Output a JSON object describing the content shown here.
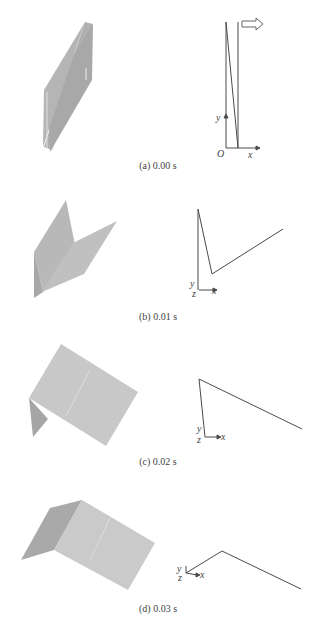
{
  "panels": [
    {
      "id": "a",
      "caption": "(a) 0.00 s",
      "time_s": 0.0,
      "axes": {
        "y": "y",
        "x": "x",
        "origin": "O"
      },
      "has_velocity_arrow": true
    },
    {
      "id": "b",
      "caption": "(b) 0.01 s",
      "time_s": 0.01,
      "axes": {
        "y": "y",
        "x": "x",
        "z": "z"
      }
    },
    {
      "id": "c",
      "caption": "(c) 0.02 s",
      "time_s": 0.02,
      "axes": {
        "y": "y",
        "x": "x",
        "z": "z"
      }
    },
    {
      "id": "d",
      "caption": "(d) 0.03 s",
      "time_s": 0.03,
      "axes": {
        "y": "y",
        "x": "x",
        "z": "z"
      }
    }
  ],
  "colors": {
    "plate_light": "#c9c9c9",
    "plate_dark": "#a9a9a9",
    "line": "#4a4a4a"
  }
}
